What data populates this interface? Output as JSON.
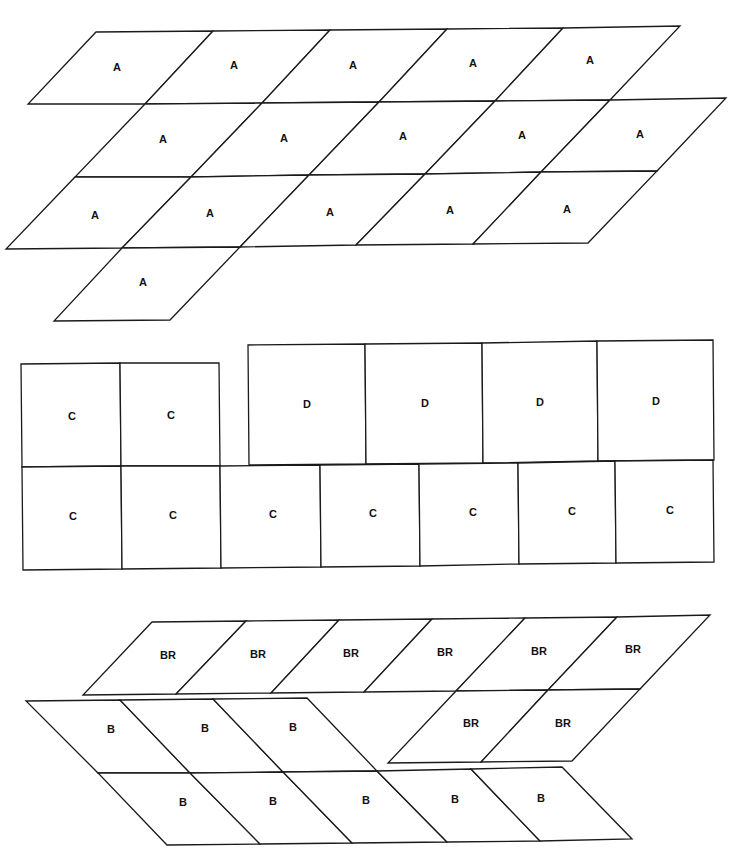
{
  "diagram": {
    "stroke_color": "#1a1a1a",
    "background": "#ffffff",
    "groups": [
      {
        "name": "group-a",
        "label": "A",
        "cells": [
          {
            "pts": "96,32 213,31 145,104 28,104",
            "label": "A",
            "lx": 117,
            "ly": 68
          },
          {
            "pts": "213,31 330,30 262,103 145,104",
            "label": "A",
            "lx": 234,
            "ly": 66
          },
          {
            "pts": "330,30 447,29 379,102 262,103",
            "label": "A",
            "lx": 353,
            "ly": 66
          },
          {
            "pts": "447,29 563,28 495,101 379,102",
            "label": "A",
            "lx": 473,
            "ly": 64
          },
          {
            "pts": "563,28 680,26 610,100 495,101",
            "label": "A",
            "lx": 590,
            "ly": 61
          },
          {
            "pts": "145,104 262,103 191,177 75,177",
            "label": "A",
            "lx": 163,
            "ly": 140
          },
          {
            "pts": "262,103 379,102 309,175 191,177",
            "label": "A",
            "lx": 284,
            "ly": 139
          },
          {
            "pts": "379,102 495,101 425,174 309,175",
            "label": "A",
            "lx": 403,
            "ly": 137
          },
          {
            "pts": "495,101 610,100 541,172 425,174",
            "label": "A",
            "lx": 522,
            "ly": 136
          },
          {
            "pts": "610,100 726,98 657,171 541,172",
            "label": "A",
            "lx": 640,
            "ly": 135
          },
          {
            "pts": "75,177 191,177 122,248 6,249",
            "label": "A",
            "lx": 95,
            "ly": 216
          },
          {
            "pts": "191,177 309,175 240,247 122,248",
            "label": "A",
            "lx": 210,
            "ly": 214
          },
          {
            "pts": "309,175 425,174 356,245 240,247",
            "label": "A",
            "lx": 330,
            "ly": 213
          },
          {
            "pts": "425,174 541,172 473,244 356,245",
            "label": "A",
            "lx": 450,
            "ly": 211
          },
          {
            "pts": "541,172 657,171 588,243 473,244",
            "label": "A",
            "lx": 567,
            "ly": 210
          },
          {
            "pts": "122,248 240,247 170,320 54,321",
            "label": "A",
            "lx": 143,
            "ly": 283
          }
        ]
      },
      {
        "name": "group-c-top",
        "label": "C",
        "cells": [
          {
            "pts": "21,364 120,363 121,466 22,467",
            "label": "C",
            "lx": 72,
            "ly": 417
          },
          {
            "pts": "120,363 219,363 220,466 121,466",
            "label": "C",
            "lx": 171,
            "ly": 416
          }
        ]
      },
      {
        "name": "group-d",
        "label": "D",
        "cells": [
          {
            "pts": "248,345 365,344 366,464 249,465",
            "label": "D",
            "lx": 307,
            "ly": 405
          },
          {
            "pts": "365,344 482,343 483,463 366,464",
            "label": "D",
            "lx": 425,
            "ly": 404
          },
          {
            "pts": "482,343 597,341 598,461 483,463",
            "label": "D",
            "lx": 540,
            "ly": 403
          },
          {
            "pts": "597,341 713,340 714,460 598,461",
            "label": "D",
            "lx": 656,
            "ly": 402
          }
        ]
      },
      {
        "name": "group-c-bottom",
        "label": "C",
        "cells": [
          {
            "pts": "22,467 121,466 122,569 23,570",
            "label": "C",
            "lx": 73,
            "ly": 517
          },
          {
            "pts": "121,466 220,466 221,568 122,569",
            "label": "C",
            "lx": 173,
            "ly": 516
          },
          {
            "pts": "220,466 320,465 321,567 221,568",
            "label": "C",
            "lx": 273,
            "ly": 515
          },
          {
            "pts": "320,465 419,464 420,566 321,567",
            "label": "C",
            "lx": 373,
            "ly": 514
          },
          {
            "pts": "419,464 518,463 519,564 420,566",
            "label": "C",
            "lx": 473,
            "ly": 513
          },
          {
            "pts": "518,463 615,461 616,563 519,564",
            "label": "C",
            "lx": 572,
            "ly": 512
          },
          {
            "pts": "615,461 713,460 714,562 616,563",
            "label": "C",
            "lx": 670,
            "ly": 511
          }
        ]
      },
      {
        "name": "group-br",
        "label": "BR",
        "cells": [
          {
            "pts": "152,622 246,621 176,694 83,695",
            "label": "BR",
            "lx": 168,
            "ly": 656
          },
          {
            "pts": "246,621 339,620 271,693 176,694",
            "label": "BR",
            "lx": 258,
            "ly": 655
          },
          {
            "pts": "339,620 432,619 364,692 271,693",
            "label": "BR",
            "lx": 351,
            "ly": 654
          },
          {
            "pts": "432,619 525,618 456,691 364,692",
            "label": "BR",
            "lx": 445,
            "ly": 653
          },
          {
            "pts": "525,618 617,617 548,690 456,691",
            "label": "BR",
            "lx": 539,
            "ly": 652
          },
          {
            "pts": "617,617 710,615 640,689 548,690",
            "label": "BR",
            "lx": 633,
            "ly": 650
          },
          {
            "pts": "456,691 548,690 481,762 388,763",
            "label": "BR",
            "lx": 471,
            "ly": 724
          },
          {
            "pts": "548,690 640,689 572,761 481,762",
            "label": "BR",
            "lx": 563,
            "ly": 724
          }
        ]
      },
      {
        "name": "group-b",
        "label": "B",
        "cells": [
          {
            "pts": "26,701 120,700 190,773 98,773",
            "label": "B",
            "lx": 111,
            "ly": 730
          },
          {
            "pts": "120,700 213,699 283,772 190,773",
            "label": "B",
            "lx": 205,
            "ly": 729
          },
          {
            "pts": "213,699 307,698 377,771 283,772",
            "label": "B",
            "lx": 293,
            "ly": 728
          },
          {
            "pts": "98,773 190,773 260,844 167,845",
            "label": "B",
            "lx": 183,
            "ly": 803
          },
          {
            "pts": "190,773 283,772 352,843 260,844",
            "label": "B",
            "lx": 273,
            "ly": 802
          },
          {
            "pts": "283,772 377,771 447,842 352,843",
            "label": "B",
            "lx": 366,
            "ly": 801
          },
          {
            "pts": "377,771 471,769 540,841 447,842",
            "label": "B",
            "lx": 455,
            "ly": 800
          },
          {
            "pts": "471,769 562,767 632,839 540,841",
            "label": "B",
            "lx": 541,
            "ly": 799
          }
        ]
      }
    ]
  }
}
